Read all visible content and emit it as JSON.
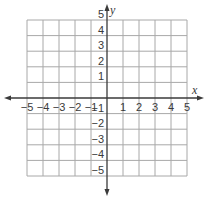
{
  "chart_data": {
    "type": "coordinate-grid",
    "title": "",
    "xlabel": "x",
    "ylabel": "y",
    "xlim": [
      -5,
      5
    ],
    "ylim": [
      -5,
      5
    ],
    "grid": true,
    "x_ticks": [
      -5,
      -4,
      -3,
      -2,
      -1,
      1,
      2,
      3,
      4,
      5
    ],
    "y_ticks": [
      5,
      4,
      3,
      2,
      1,
      -1,
      -2,
      -3,
      -4,
      -5
    ],
    "x_tick_labels": [
      "−5",
      "−4",
      "−3",
      "−2",
      "−1",
      "1",
      "2",
      "3",
      "4",
      "5"
    ],
    "y_tick_labels": [
      "5",
      "4",
      "3",
      "2",
      "1",
      "−1",
      "−2",
      "−3",
      "−4",
      "−5"
    ],
    "series": []
  },
  "colors": {
    "grid": "#a8a8a8",
    "axis": "#3a3a3a",
    "text": "#3a3a3a"
  }
}
